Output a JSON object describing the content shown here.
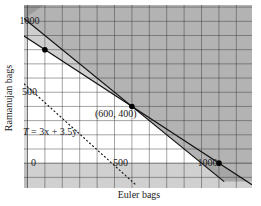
{
  "chart_data": {
    "type": "line",
    "title": "",
    "xlabel": "Euler bags",
    "ylabel": "Ramanujan bags",
    "xlim": [
      -20,
      1290
    ],
    "ylim": [
      -175,
      1115
    ],
    "grid": true,
    "grid_step": 100,
    "x_ticks": [
      {
        "value": 0,
        "label": "0"
      },
      {
        "value": 500,
        "label": "500"
      },
      {
        "value": 1000,
        "label": "1000"
      }
    ],
    "y_ticks": [
      {
        "value": 500,
        "label": "500"
      },
      {
        "value": 1000,
        "label": "1000"
      }
    ],
    "constraints": [
      {
        "name": "x + y = 1000",
        "points": [
          [
            -20,
            1020
          ],
          [
            1130,
            -130
          ]
        ]
      },
      {
        "name": "0.8x + y = 880",
        "points": [
          [
            -20,
            896
          ],
          [
            1290,
            -152
          ]
        ]
      }
    ],
    "objective": {
      "label": "T = 3x + 3.5y",
      "points": [
        [
          -20,
          560
        ],
        [
          620,
          -150
        ]
      ]
    },
    "highlight_points": [
      {
        "x": 100,
        "y": 800,
        "label": ""
      },
      {
        "x": 600,
        "y": 400,
        "label": "(600, 400)"
      },
      {
        "x": 1100,
        "y": 0,
        "label": ""
      }
    ],
    "annotations": [
      {
        "text": "(600, 400)",
        "x": 420,
        "y": 330
      },
      {
        "text_italic": "T",
        "text": " = 3x + 3.5y",
        "x": 10,
        "y": 195
      }
    ]
  }
}
